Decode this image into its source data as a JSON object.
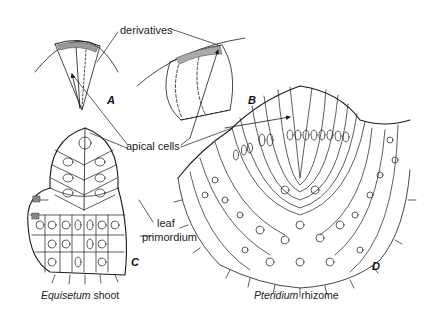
{
  "labels": {
    "derivatives": "derivatives",
    "apical_cells": "apical cells",
    "leaf": "leaf",
    "primordium": "primordium"
  },
  "panels": {
    "a": "A",
    "b": "B",
    "c": "C",
    "d": "D"
  },
  "captions": {
    "equisetum_genus": "Equisetum",
    "equisetum_part": " shoot",
    "pteridium_genus": "Pteridium",
    "pteridium_part": " rhizome"
  },
  "colors": {
    "line": "#1a1a1a",
    "background": "#ffffff"
  }
}
